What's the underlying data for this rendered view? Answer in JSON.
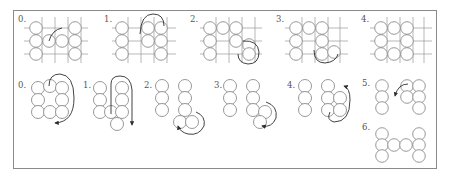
{
  "figure": {
    "top_row": {
      "description": "Grid weaving steps with beads on crossing threads",
      "panels": [
        {
          "label": "0."
        },
        {
          "label": "1."
        },
        {
          "label": "2."
        },
        {
          "label": "3."
        },
        {
          "label": "4."
        }
      ]
    },
    "bottom_row": {
      "description": "Bead column construction steps with thread path arrows",
      "panels": [
        {
          "label": "0."
        },
        {
          "label": "1."
        },
        {
          "label": "2."
        },
        {
          "label": "3."
        },
        {
          "label": "4."
        },
        {
          "label": "5."
        },
        {
          "label": "6."
        }
      ]
    },
    "colors": {
      "bead_stroke": "#8c8c8c",
      "grid_line": "#9a9a9a",
      "thread": "#2e2e2e",
      "frame": "#8a8a8a",
      "label": "#555555"
    }
  }
}
